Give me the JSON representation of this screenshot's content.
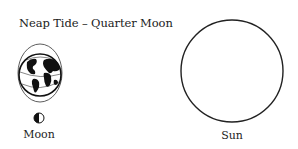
{
  "title": "Neap Tide – Quarter Moon",
  "moon": {
    "label": "Moon",
    "phase_icon": "first-quarter-moon-icon"
  },
  "sun": {
    "label": "Sun"
  },
  "earth": {
    "icon": "earth-globe-icon",
    "tidal_bulge": "ellipse"
  },
  "colors": {
    "line": "#222222",
    "background": "#ffffff"
  }
}
